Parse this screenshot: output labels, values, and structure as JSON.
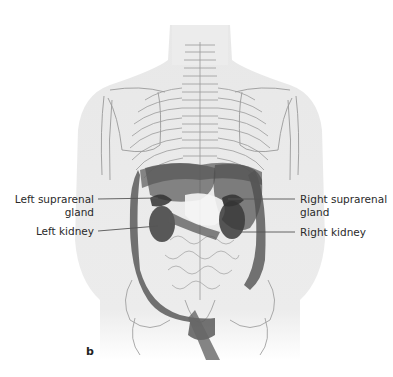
{
  "figure": {
    "panel_letter": "b",
    "view": "posterior view of torso with retroperitoneal organs",
    "colors": {
      "background": "#ffffff",
      "skin": "#e9e9e9",
      "bone_outline": "#9a9a9a",
      "organ_dark": "#4a4a4a",
      "organ_mid": "#6e6e6e",
      "leader_line": "#555555",
      "label_text": "#2a2a2a"
    }
  },
  "labels": {
    "left_suprarenal_line1": "Left suprarenal",
    "left_suprarenal_line2": "gland",
    "left_kidney": "Left kidney",
    "right_suprarenal_line1": "Right suprarenal",
    "right_suprarenal_line2": "gland",
    "right_kidney": "Right kidney"
  }
}
